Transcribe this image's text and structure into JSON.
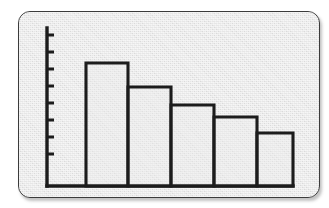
{
  "figure": {
    "kind": "bar-chart-figure",
    "frame_style": "rounded-plate",
    "plate_color": "#e6e6e6",
    "ink_color": "#1c1c1c",
    "page_color": "#ffffff",
    "title": "",
    "caption": ""
  },
  "chart_data": {
    "type": "bar",
    "title": "",
    "subtitle": "",
    "xlabel": "",
    "ylabel": "",
    "categories": [
      "1",
      "2",
      "3",
      "4",
      "5"
    ],
    "values": [
      7.3,
      5.9,
      4.8,
      4.1,
      3.2
    ],
    "ylim": [
      0,
      9
    ],
    "xlim": [
      0,
      5
    ],
    "grid": false,
    "legend": false,
    "legend_position": "none",
    "x_tick_labels": [],
    "y_tick_labels": [],
    "y_tick_count": 8,
    "annotations": [],
    "series": [
      {
        "name": "series-1",
        "values": [
          7.3,
          5.9,
          4.8,
          4.1,
          3.2
        ]
      }
    ],
    "bar_fill": "#ececec",
    "bar_outline": "#1c1c1c",
    "axis_color": "#1c1c1c"
  },
  "geometry": {
    "plot_left": 28,
    "plot_baseline": 174,
    "plot_top": 16,
    "axis_x": 28,
    "axis_top": 16,
    "bar_width": 42,
    "bar_lefts": [
      67,
      109,
      152,
      195,
      238
    ],
    "bar_tops": [
      51,
      75,
      93,
      105,
      121
    ],
    "axis_right": 274,
    "tick_ys": [
      23,
      40,
      57,
      74,
      91,
      108,
      125,
      142
    ],
    "tick_length": 7
  }
}
